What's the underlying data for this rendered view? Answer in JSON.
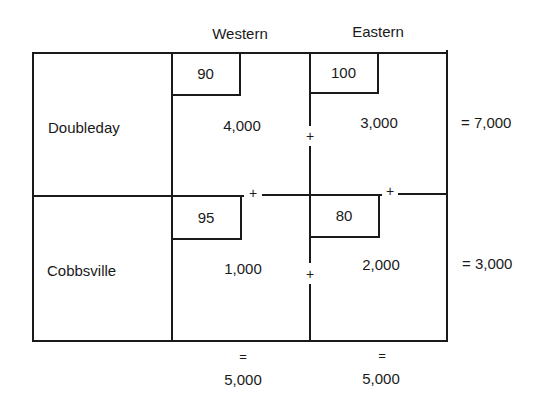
{
  "columns": [
    {
      "label": "Western",
      "total_eq": "=",
      "total": "5,000"
    },
    {
      "label": "Eastern",
      "total_eq": "=",
      "total": "5,000"
    }
  ],
  "rows": [
    {
      "label": "Doubleday",
      "total": "= 7,000",
      "cells": [
        {
          "cost": "90",
          "allocation": "4,000"
        },
        {
          "cost": "100",
          "allocation": "3,000"
        }
      ]
    },
    {
      "label": "Cobbsville",
      "total": "= 3,000",
      "cells": [
        {
          "cost": "95",
          "allocation": "1,000"
        },
        {
          "cost": "80",
          "allocation": "2,000"
        }
      ]
    }
  ],
  "markers": {
    "plus": "+"
  }
}
